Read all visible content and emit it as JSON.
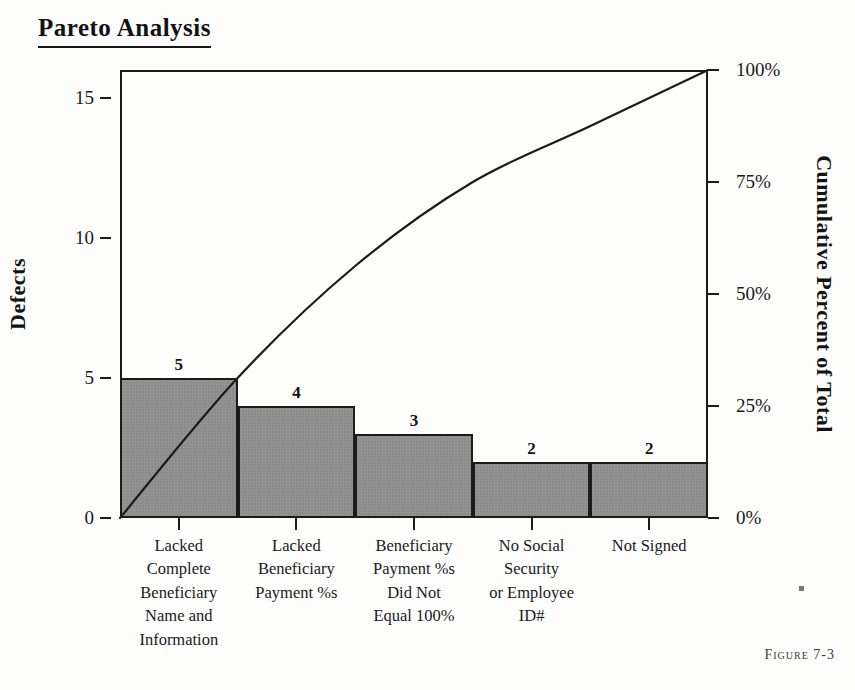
{
  "title": "Pareto Analysis",
  "figure_caption": "Figure 7-3",
  "colors": {
    "bar_fill": "#8d8d8d",
    "bar_border": "#1b1b1b",
    "line": "#1b1b1b",
    "text": "#1a1a1a",
    "background": "#fdfdfc"
  },
  "chart_data": {
    "type": "bar",
    "title": "Pareto Analysis",
    "xlabel": "",
    "ylabel": "Defects",
    "y2label": "Cumulative Percent of Total",
    "ylim": [
      0,
      16
    ],
    "y2lim": [
      0,
      100
    ],
    "grid": false,
    "legend": "none",
    "categories": [
      "Lacked Complete Beneficiary Name and Information",
      "Lacked Beneficiary Payment %s",
      "Beneficiary Payment %s Did Not Equal 100%",
      "No Social Security or Employee ID#",
      "Not Signed"
    ],
    "category_lines": [
      [
        "Lacked",
        "Complete",
        "Beneficiary",
        "Name and",
        "Information"
      ],
      [
        "Lacked",
        "Beneficiary",
        "Payment %s"
      ],
      [
        "Beneficiary",
        "Payment %s",
        "Did Not",
        "Equal 100%"
      ],
      [
        "No Social",
        "Security",
        "or Employee",
        "ID#"
      ],
      [
        "Not Signed"
      ]
    ],
    "values": [
      5,
      4,
      3,
      2,
      2
    ],
    "value_labels": [
      "5",
      "4",
      "3",
      "2",
      "2"
    ],
    "total_defects": 16,
    "cumulative_percent": [
      31.25,
      56.25,
      75,
      87.5,
      100
    ],
    "y_ticks": [
      0,
      5,
      10,
      15
    ],
    "y_tick_labels": [
      "0",
      "5",
      "10",
      "15"
    ],
    "y2_ticks": [
      0,
      25,
      50,
      75,
      100
    ],
    "y2_tick_labels": [
      "0%",
      "25%",
      "50%",
      "75%",
      "100%"
    ],
    "series": [
      {
        "name": "Defects",
        "type": "bar",
        "values": [
          5,
          4,
          3,
          2,
          2
        ]
      },
      {
        "name": "Cumulative Percent of Total",
        "type": "line",
        "values": [
          31.25,
          56.25,
          75,
          87.5,
          100
        ]
      }
    ]
  }
}
